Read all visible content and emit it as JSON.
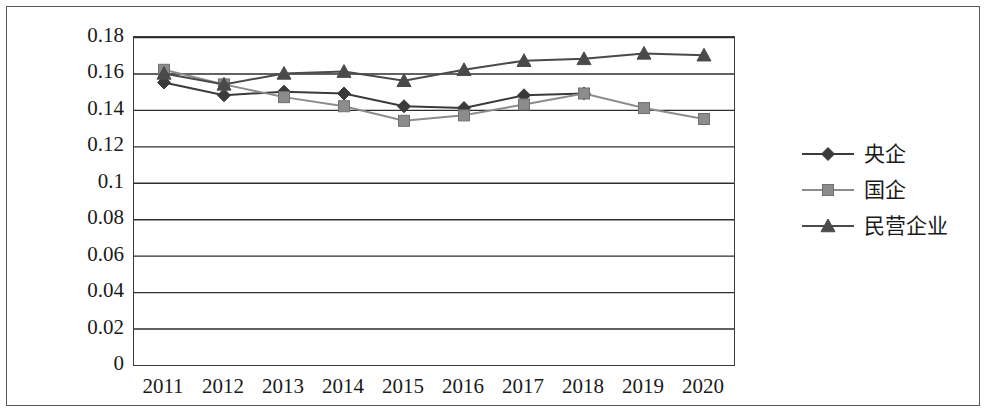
{
  "chart_data": {
    "type": "line",
    "title": "",
    "xlabel": "",
    "ylabel": "",
    "categories": [
      "2011",
      "2012",
      "2013",
      "2014",
      "2015",
      "2016",
      "2017",
      "2018",
      "2019",
      "2020"
    ],
    "ylim": [
      0,
      0.18
    ],
    "yticks": [
      "0",
      "0.02",
      "0.04",
      "0.06",
      "0.08",
      "0.1",
      "0.12",
      "0.14",
      "0.16",
      "0.18"
    ],
    "ytick_values": [
      0,
      0.02,
      0.04,
      0.06,
      0.08,
      0.1,
      0.12,
      0.14,
      0.16,
      0.18
    ],
    "grid": true,
    "grid_axis": "y",
    "legend_position": "right",
    "series": [
      {
        "name": "央企",
        "marker": "diamond",
        "color": "#3a3a3a",
        "values": [
          0.155,
          0.148,
          0.15,
          0.149,
          0.142,
          0.141,
          0.148,
          0.149,
          null,
          null
        ]
      },
      {
        "name": "国企",
        "marker": "square",
        "color": "#8c8c8c",
        "values": [
          0.162,
          0.154,
          0.147,
          0.142,
          0.134,
          0.137,
          0.143,
          0.149,
          0.141,
          0.135
        ]
      },
      {
        "name": "民营企业",
        "marker": "triangle",
        "color": "#4a4a4a",
        "values": [
          0.16,
          0.154,
          0.16,
          0.161,
          0.156,
          0.162,
          0.167,
          0.168,
          0.171,
          0.17
        ]
      }
    ]
  },
  "legend": {
    "items": [
      {
        "label": "央企",
        "marker": "diamond",
        "color": "#3a3a3a"
      },
      {
        "label": "国企",
        "marker": "square",
        "color": "#8c8c8c"
      },
      {
        "label": "民营企业",
        "marker": "triangle",
        "color": "#4a4a4a"
      }
    ]
  },
  "colors": {
    "axis": "#3b3b3b",
    "grid": "#2e2e2e",
    "frame": "#5a5a5a",
    "text": "#1a1a1a",
    "background": "#ffffff"
  }
}
